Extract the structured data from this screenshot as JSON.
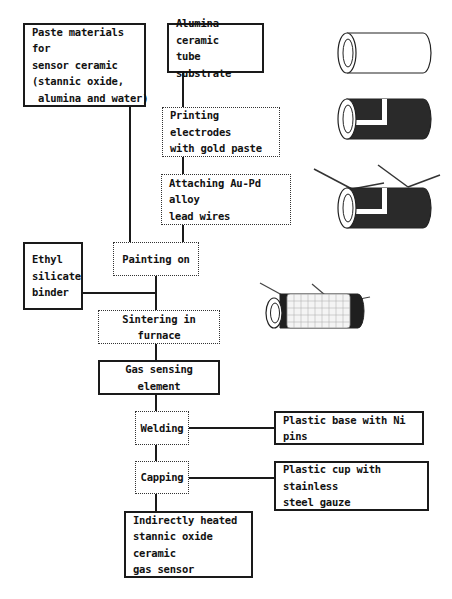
{
  "diagram": {
    "nodes": {
      "paste_materials": {
        "lines": [
          "Paste materials for",
          "sensor ceramic",
          "(stannic oxide,",
          " alumina and water)"
        ],
        "style": "solid"
      },
      "alumina_tube": {
        "lines": [
          "Alumina ceramic",
          "tube substrate"
        ],
        "style": "solid"
      },
      "printing_electrodes": {
        "lines": [
          "Printing electrodes",
          "with gold paste"
        ],
        "style": "dotted"
      },
      "attaching_wires": {
        "lines": [
          "Attaching Au-Pd alloy",
          "lead wires"
        ],
        "style": "dotted"
      },
      "painting_on": {
        "lines": [
          "Painting on"
        ],
        "style": "dotted"
      },
      "ethyl_binder": {
        "lines": [
          "Ethyl",
          "silicate",
          "binder"
        ],
        "style": "solid"
      },
      "sintering": {
        "lines": [
          "Sintering in furnace"
        ],
        "style": "dotted"
      },
      "gas_element": {
        "lines": [
          "Gas sensing element"
        ],
        "style": "solid"
      },
      "welding": {
        "lines": [
          "Welding"
        ],
        "style": "dotted"
      },
      "plastic_base": {
        "lines": [
          "Plastic base with Ni pins"
        ],
        "style": "solid"
      },
      "capping": {
        "lines": [
          "Capping"
        ],
        "style": "dotted"
      },
      "plastic_cup": {
        "lines": [
          "Plastic cup with stainless",
          "steel gauze"
        ],
        "style": "solid"
      },
      "final_sensor": {
        "lines": [
          "Indirectly heated",
          "stannic oxide ceramic",
          "gas sensor"
        ],
        "style": "solid"
      }
    },
    "edges": [
      [
        "alumina_tube",
        "printing_electrodes"
      ],
      [
        "printing_electrodes",
        "attaching_wires"
      ],
      [
        "attaching_wires",
        "painting_on"
      ],
      [
        "paste_materials",
        "painting_on"
      ],
      [
        "painting_on",
        "sintering"
      ],
      [
        "ethyl_binder",
        "sintering"
      ],
      [
        "sintering",
        "gas_element"
      ],
      [
        "gas_element",
        "welding"
      ],
      [
        "plastic_base",
        "welding"
      ],
      [
        "welding",
        "capping"
      ],
      [
        "plastic_cup",
        "capping"
      ],
      [
        "capping",
        "final_sensor"
      ]
    ],
    "illustrations": [
      {
        "name": "bare-alumina-tube",
        "stage": "alumina_tube"
      },
      {
        "name": "tube-with-gold-electrodes",
        "stage": "printing_electrodes"
      },
      {
        "name": "tube-with-lead-wires",
        "stage": "attaching_wires"
      },
      {
        "name": "tube-with-heater-coil-and-coating",
        "stage": "sintering"
      }
    ],
    "colors": {
      "line": "#1a1a1a",
      "background": "#ffffff",
      "electrode": "#2a2a2a"
    }
  }
}
